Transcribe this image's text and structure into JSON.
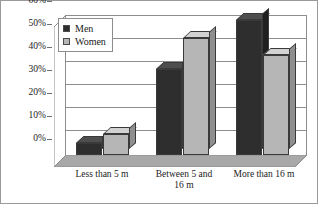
{
  "chart_data": {
    "type": "bar",
    "title": "",
    "xlabel": "",
    "ylabel": "",
    "categories": [
      "Less than 5 m",
      "Between 5 and 16 m",
      "More than 16 m"
    ],
    "category_lines": [
      [
        "Less than 5 m"
      ],
      [
        "Between 5 and",
        "16 m"
      ],
      [
        "More than 16 m"
      ]
    ],
    "series": [
      {
        "name": "Men",
        "values": [
          5,
          37,
          58
        ],
        "color": "#2e2e2e"
      },
      {
        "name": "Women",
        "values": [
          9,
          50,
          43
        ],
        "color": "#b6b6b6"
      }
    ],
    "ylim": [
      0,
      60
    ],
    "ytick_values": [
      0,
      10,
      20,
      30,
      40,
      50,
      60
    ],
    "ytick_labels": [
      "0%",
      "10%",
      "20%",
      "30%",
      "40%",
      "50%",
      "60%"
    ],
    "grid": true,
    "legend_position": "top-left",
    "style": "3d-grouped-bar"
  },
  "legend": {
    "entries": [
      {
        "label": "Men"
      },
      {
        "label": "Women"
      }
    ]
  },
  "yaxis": {
    "t0": "0%",
    "t1": "10%",
    "t2": "20%",
    "t3": "30%",
    "t4": "40%",
    "t5": "50%",
    "t6": "60%"
  },
  "xaxis": {
    "c0l0": "Less than 5 m",
    "c1l0": "Between 5 and",
    "c1l1": "16 m",
    "c2l0": "More than 16 m"
  }
}
